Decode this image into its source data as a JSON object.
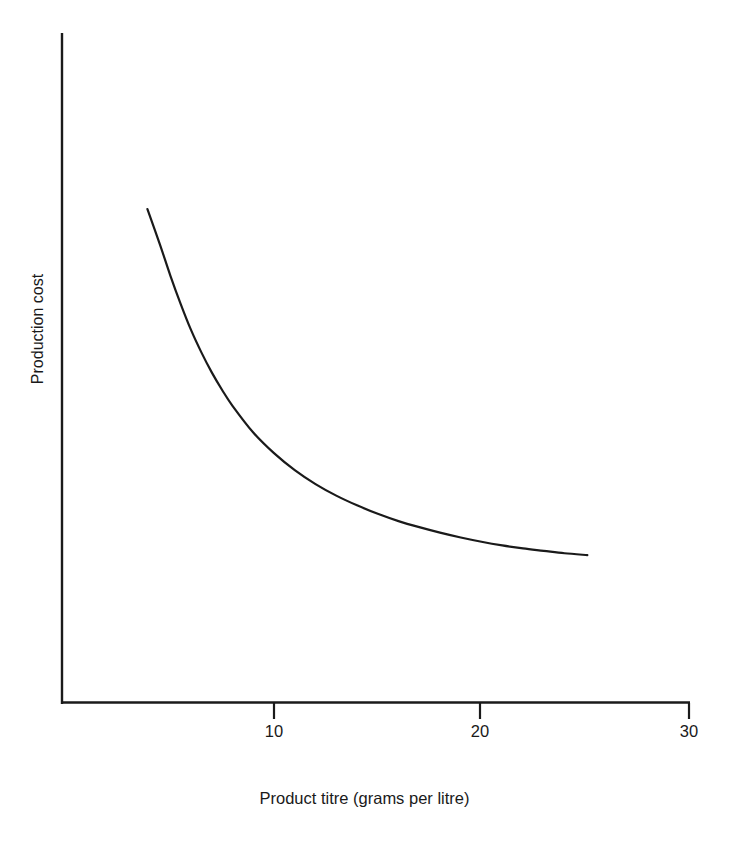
{
  "figure": {
    "title_cut_off": "",
    "background_color": "#ffffff",
    "line_color": "#1a1a1a",
    "axis_color": "#1a1a1a"
  },
  "axes": {
    "ylabel": "Production cost",
    "xlabel": "Product titre (grams per litre)",
    "xtick_10": "10",
    "xtick_20": "20",
    "xtick_30": "30"
  },
  "chart_data": {
    "type": "line",
    "title": "",
    "xlabel": "Product titre (grams per litre)",
    "ylabel": "Production cost",
    "xlim": [
      0,
      30
    ],
    "ylim": [
      0,
      100
    ],
    "xticks": [
      10,
      20,
      30
    ],
    "xticklabels": [
      "10",
      "20",
      "30"
    ],
    "yticks": [],
    "yticklabels": [],
    "grid": false,
    "legend": false,
    "legend_position": "none",
    "y_axis_units": "arbitrary (unlabelled relative cost)",
    "annotations": [],
    "series": [
      {
        "name": "Production cost vs product titre",
        "marker": "none",
        "linewidth": 2.2,
        "color": "#1a1a1a",
        "x": [
          3.9,
          4.5,
          5.0,
          5.5,
          6.0,
          6.5,
          7.0,
          7.5,
          8.0,
          9.0,
          10.0,
          11.0,
          12.0,
          13.0,
          14.0,
          15.0,
          16.0,
          17.0,
          18.0,
          19.0,
          20.0,
          21.0,
          22.0,
          23.0,
          24.0,
          25.1
        ],
        "y": [
          81.2,
          75.4,
          70.3,
          65.6,
          61.3,
          57.6,
          54.3,
          51.4,
          48.8,
          44.4,
          41.0,
          38.2,
          35.9,
          34.0,
          32.4,
          31.0,
          29.8,
          28.8,
          27.9,
          27.1,
          26.4,
          25.8,
          25.3,
          24.9,
          24.5,
          24.2
        ]
      }
    ]
  }
}
